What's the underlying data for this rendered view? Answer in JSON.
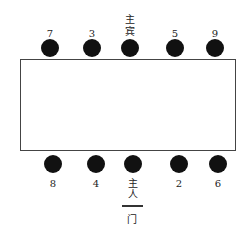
{
  "top_seats": [
    {
      "label": "7",
      "x": 50
    },
    {
      "label": "3",
      "x": 92
    },
    {
      "label": "主宾",
      "x": 130
    },
    {
      "label": "5",
      "x": 175
    },
    {
      "label": "9",
      "x": 215
    }
  ],
  "bottom_seats": [
    {
      "label": "8",
      "x": 53
    },
    {
      "label": "4",
      "x": 96
    },
    {
      "label": "主人",
      "x": 133
    },
    {
      "label": "2",
      "x": 179
    },
    {
      "label": "6",
      "x": 218
    }
  ],
  "door_label": "门",
  "top": {
    "l0": "7",
    "l1": "3",
    "l2a": "主",
    "l2b": "宾",
    "l3": "5",
    "l4": "9"
  },
  "bottom": {
    "l0": "8",
    "l1": "4",
    "l2a": "主",
    "l2b": "人",
    "l3": "2",
    "l4": "6"
  }
}
